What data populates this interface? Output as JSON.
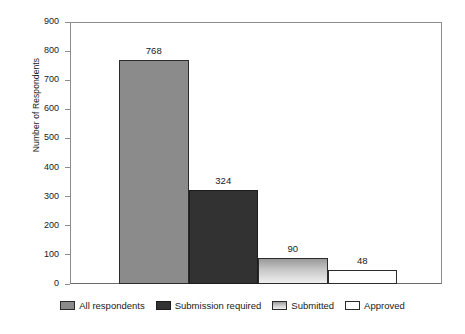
{
  "chart_data": {
    "type": "bar",
    "title": "",
    "xlabel": "",
    "ylabel": "Number of Respondents",
    "categories": [
      "All respondents",
      "Submission required",
      "Submitted",
      "Approved"
    ],
    "values": [
      768,
      324,
      90,
      48
    ],
    "value_labels": [
      "768",
      "324",
      "90",
      "48"
    ],
    "ylim": [
      0,
      900
    ],
    "ytick_labels": [
      "900",
      "800",
      "700",
      "600",
      "500",
      "400",
      "300",
      "200",
      "100",
      "0"
    ],
    "ytick_values": [
      900,
      800,
      700,
      600,
      500,
      400,
      300,
      200,
      100,
      0
    ],
    "grid": false,
    "legend_position": "bottom",
    "series": [
      {
        "name": "All respondents",
        "value": 768,
        "label": "768",
        "fill": "solid-mid",
        "color": "#8b8b8b"
      },
      {
        "name": "Submission required",
        "value": 324,
        "label": "324",
        "fill": "solid-dark",
        "color": "#323232"
      },
      {
        "name": "Submitted",
        "value": 90,
        "label": "90",
        "fill": "gradient-light",
        "color": "#c7c7c7"
      },
      {
        "name": "Approved",
        "value": 48,
        "label": "48",
        "fill": "white",
        "color": "#ffffff"
      }
    ]
  },
  "legend": {
    "items": [
      {
        "label": "All respondents"
      },
      {
        "label": "Submission required"
      },
      {
        "label": "Submitted"
      },
      {
        "label": "Approved"
      }
    ]
  }
}
